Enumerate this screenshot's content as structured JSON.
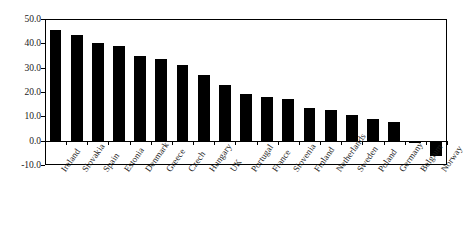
{
  "chart_data": {
    "type": "bar",
    "title": "",
    "subtitle": "",
    "xlabel": "",
    "ylabel": "",
    "ylim": [
      -10.0,
      50.0
    ],
    "yticks": [
      "-10.0",
      "0.0",
      "10.0",
      "20.0",
      "30.0",
      "40.0",
      "50.0"
    ],
    "ytick_values": [
      -10.0,
      0.0,
      10.0,
      20.0,
      30.0,
      40.0,
      50.0
    ],
    "grid": false,
    "legend": "none",
    "bar_color": "#000000",
    "axis_color": "#000000",
    "background": "#ffffff",
    "categories": [
      "Ireland",
      "Slovakia",
      "Spain",
      "Estonia",
      "Denmark",
      "Greece",
      "Czech",
      "Hungary",
      "UK",
      "Portugal",
      "France",
      "Slovenia",
      "Finland",
      "Netherlands",
      "Sweden",
      "Poland",
      "Germany",
      "Belgium",
      "Norway"
    ],
    "values": [
      45.5,
      43.5,
      40.0,
      39.0,
      35.0,
      33.5,
      31.0,
      27.0,
      23.0,
      19.0,
      18.0,
      17.0,
      13.5,
      12.5,
      10.5,
      9.0,
      7.5,
      -1.0,
      -6.5
    ]
  }
}
